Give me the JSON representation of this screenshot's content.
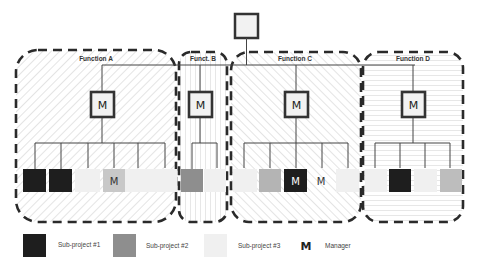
{
  "colors": {
    "subproject1": "#1e1e1e",
    "subproject2": "#8e8e8e",
    "subproject3": "#f0f0f0",
    "manager_box_fill": "#f2f2f2",
    "line": "#444444",
    "dash": "#2a2a2a"
  },
  "top_node": {
    "label": ""
  },
  "functions": [
    {
      "id": "A",
      "title": "Function A",
      "hatch": "diag-left",
      "manager_label": "M",
      "members": [
        {
          "type": "subproject1",
          "label": ""
        },
        {
          "type": "subproject1",
          "label": ""
        },
        {
          "type": "subproject3",
          "label": ""
        },
        {
          "type": "subproject2",
          "label": "M"
        },
        {
          "type": "subproject3",
          "label": ""
        },
        {
          "type": "subproject3",
          "label": ""
        }
      ]
    },
    {
      "id": "B",
      "title": "Funct. B",
      "hatch": "vertical",
      "manager_label": "M",
      "members": [
        {
          "type": "subproject2",
          "label": ""
        },
        {
          "type": "subproject3",
          "label": ""
        }
      ]
    },
    {
      "id": "C",
      "title": "Function C",
      "hatch": "diag-right",
      "manager_label": "M",
      "members": [
        {
          "type": "subproject3",
          "label": ""
        },
        {
          "type": "subproject2",
          "label": ""
        },
        {
          "type": "subproject1",
          "label": "M"
        },
        {
          "type": "none",
          "label": "M"
        },
        {
          "type": "subproject3",
          "label": ""
        }
      ]
    },
    {
      "id": "D",
      "title": "Function D",
      "hatch": "horizontal",
      "manager_label": "M",
      "members": [
        {
          "type": "subproject3",
          "label": ""
        },
        {
          "type": "subproject1",
          "label": ""
        },
        {
          "type": "subproject3",
          "label": ""
        },
        {
          "type": "subproject2",
          "label": ""
        }
      ]
    }
  ],
  "legend": [
    {
      "type": "subproject1",
      "label": "Sub-project #1"
    },
    {
      "type": "subproject2",
      "label": "Sub-project  #2"
    },
    {
      "type": "subproject3",
      "label": "Sub-project #3"
    },
    {
      "type": "manager",
      "symbol": "M",
      "label": "Manager"
    }
  ]
}
